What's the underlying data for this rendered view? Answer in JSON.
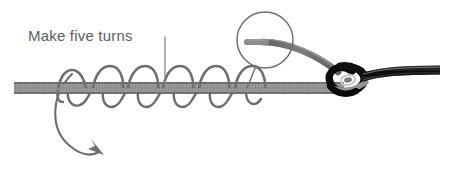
{
  "diagram": {
    "title_text": "Make five turns",
    "type": "fishing-knot-instruction",
    "turns_count": 5,
    "colors": {
      "main_line": "#8c8c8c",
      "main_line_edge": "#6f6f6f",
      "wrap_line": "#6b6b6b",
      "knot_dark": "#111111",
      "doubled_line": "#080808",
      "annotation": "#5d5d5d",
      "background": "#ffffff"
    },
    "annotations": {
      "label": "Make five turns",
      "leader_line_name": "callout-leader-line",
      "arrow_name": "direction-arrow",
      "circle_name": "highlight-circle"
    },
    "elements": {
      "main_line_label": "standing line",
      "wraps_label": "five wraps",
      "tag_end_label": "tag end",
      "knot_label": "knot loop",
      "doubled_line_label": "doubled line"
    }
  }
}
